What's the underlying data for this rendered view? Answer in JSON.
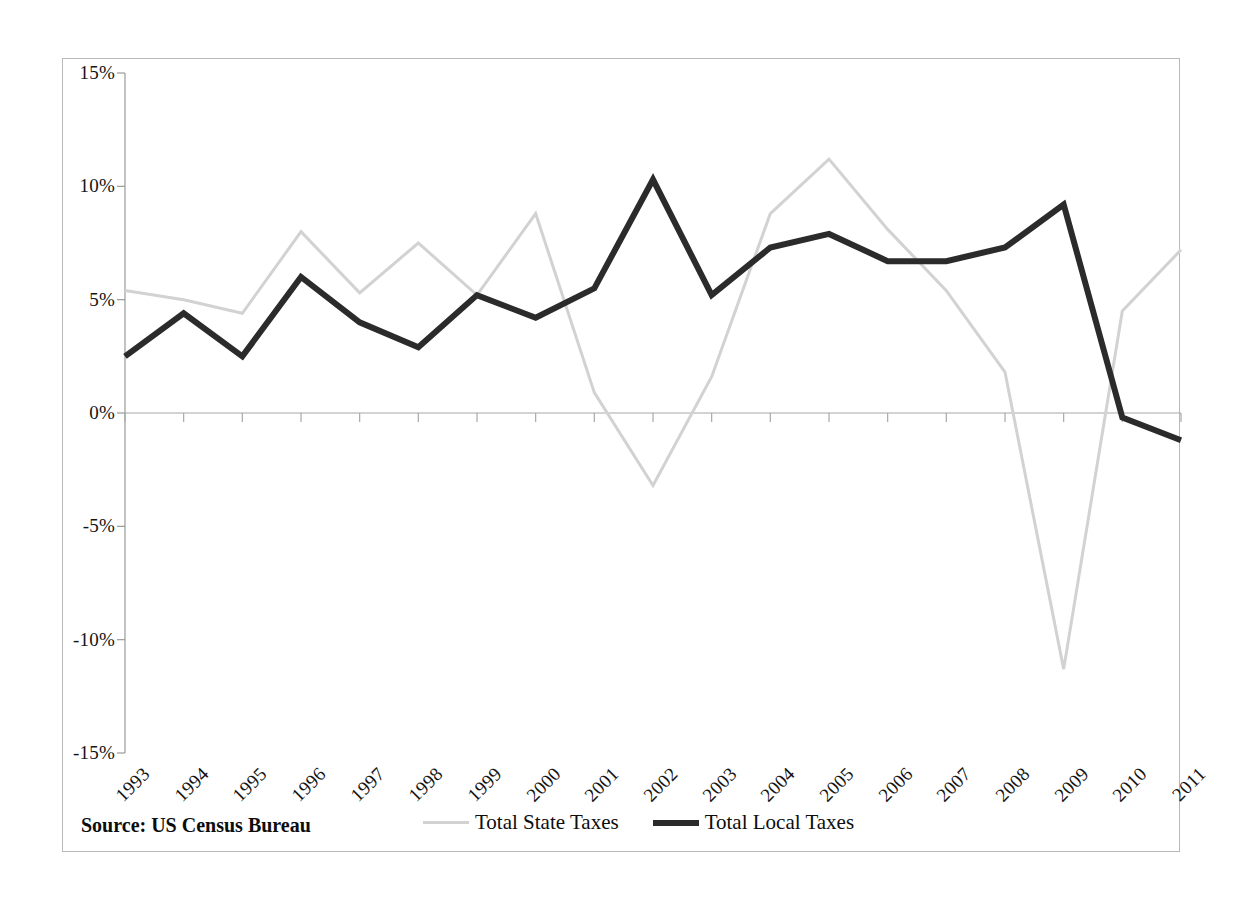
{
  "chart_data": {
    "type": "line",
    "title": "",
    "xlabel": "",
    "ylabel": "",
    "categories": [
      "1993",
      "1994",
      "1995",
      "1996",
      "1997",
      "1998",
      "1999",
      "2000",
      "2001",
      "2002",
      "2003",
      "2004",
      "2005",
      "2006",
      "2007",
      "2008",
      "2009",
      "2010",
      "2011"
    ],
    "ylim": [
      -15,
      15
    ],
    "ytick_labels": [
      "15%",
      "10%",
      "5%",
      "0%",
      "-5%",
      "-10%",
      "-15%"
    ],
    "ytick_values": [
      15,
      10,
      5,
      0,
      -5,
      -10,
      -15
    ],
    "grid": false,
    "legend_position": "bottom",
    "series": [
      {
        "name": "Total State Taxes",
        "color": "#d2d2d2",
        "width": 3,
        "values": [
          5.4,
          5.0,
          4.4,
          8.0,
          5.3,
          7.5,
          5.2,
          8.8,
          0.9,
          -3.2,
          1.6,
          8.8,
          11.2,
          8.1,
          5.4,
          1.8,
          -11.3,
          4.5,
          7.2
        ]
      },
      {
        "name": "Total Local Taxes",
        "color": "#2b2b2b",
        "width": 6,
        "values": [
          2.5,
          4.4,
          2.5,
          6.0,
          4.0,
          2.9,
          5.2,
          4.2,
          5.5,
          10.3,
          5.2,
          7.3,
          7.9,
          6.7,
          6.7,
          7.3,
          9.2,
          -0.2,
          -1.2
        ]
      }
    ],
    "annotations": {
      "source": "Source: US Census Bureau"
    }
  },
  "legend": {
    "entries": [
      {
        "label": "Total State Taxes"
      },
      {
        "label": "Total Local Taxes"
      }
    ]
  },
  "footer": {
    "source": "Source: US Census Bureau"
  }
}
